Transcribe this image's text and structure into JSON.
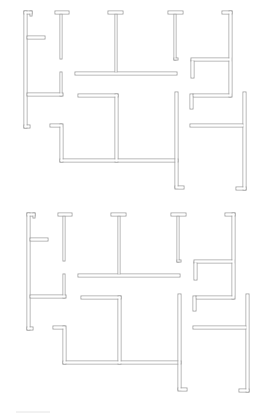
{
  "diagram": {
    "wall_color": "#9a9a9a",
    "fill_color": "#ffffff",
    "background": "#ffffff",
    "plans": [
      {
        "name": "plan-top",
        "offset_x": 0,
        "offset_y": 0
      },
      {
        "name": "plan-bottom",
        "offset_x": 3,
        "offset_y": 202
      }
    ],
    "walls": [
      {
        "id": "left-wall",
        "rects": [
          [
            24,
            11,
            3,
            117
          ],
          [
            24,
            11,
            8,
            3
          ],
          [
            30,
            11,
            2,
            5
          ],
          [
            24,
            125,
            6,
            3
          ]
        ]
      },
      {
        "id": "left-stub",
        "rects": [
          [
            27,
            36,
            18,
            3
          ]
        ]
      },
      {
        "id": "tee-1",
        "rects": [
          [
            55,
            11,
            14,
            3
          ],
          [
            60,
            14,
            2,
            45
          ]
        ]
      },
      {
        "id": "tee-1-lower",
        "rects": [
          [
            60,
            72,
            2,
            24
          ],
          [
            27,
            93,
            36,
            3
          ]
        ]
      },
      {
        "id": "tee-2",
        "rects": [
          [
            108,
            11,
            15,
            3
          ],
          [
            115,
            14,
            2,
            59
          ],
          [
            75,
            72,
            102,
            3
          ]
        ]
      },
      {
        "id": "tee-3",
        "rects": [
          [
            168,
            11,
            15,
            3
          ],
          [
            174,
            14,
            2,
            46
          ],
          [
            174,
            58,
            4,
            2
          ]
        ]
      },
      {
        "id": "right-top",
        "rects": [
          [
            222,
            11,
            10,
            3
          ],
          [
            229,
            11,
            3,
            86
          ],
          [
            191,
            58,
            40,
            3
          ],
          [
            191,
            60,
            3,
            18
          ],
          [
            193,
            94,
            38,
            3
          ],
          [
            190,
            94,
            3,
            15
          ]
        ]
      },
      {
        "id": "far-right",
        "rects": [
          [
            243,
            92,
            3,
            98
          ],
          [
            236,
            187,
            10,
            3
          ],
          [
            190,
            124,
            54,
            3
          ]
        ]
      },
      {
        "id": "center-room",
        "rects": [
          [
            78,
            94,
            40,
            3
          ],
          [
            115,
            94,
            3,
            68
          ],
          [
            60,
            159,
            118,
            3
          ],
          [
            60,
            124,
            3,
            38
          ],
          [
            50,
            124,
            12,
            3
          ]
        ]
      },
      {
        "id": "center-right",
        "rects": [
          [
            175,
            92,
            3,
            96
          ],
          [
            175,
            186,
            9,
            3
          ]
        ]
      }
    ],
    "scale_bar": {
      "x1": 16,
      "x2": 50,
      "y": 412
    }
  }
}
